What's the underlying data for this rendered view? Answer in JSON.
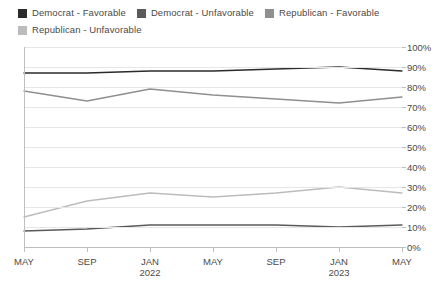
{
  "legend": {
    "position": "top-left",
    "items": [
      {
        "label": "Democrat - Favorable",
        "color": "#2b2b2b",
        "key": "dem_fav"
      },
      {
        "label": "Democrat - Unfavorable",
        "color": "#5a5a5a",
        "key": "dem_unfav"
      },
      {
        "label": "Republican - Favorable",
        "color": "#8f8f8f",
        "key": "rep_fav"
      },
      {
        "label": "Republican - Unfavorable",
        "color": "#bcbcbc",
        "key": "rep_unfav"
      }
    ]
  },
  "axes": {
    "y_labels": [
      "100%",
      "90%",
      "80%",
      "70%",
      "60%",
      "50%",
      "40%",
      "30%",
      "20%",
      "10%",
      "0%"
    ],
    "x_labels": [
      {
        "month": "MAY",
        "year": ""
      },
      {
        "month": "SEP",
        "year": ""
      },
      {
        "month": "JAN",
        "year": "2022"
      },
      {
        "month": "MAY",
        "year": ""
      },
      {
        "month": "SEP",
        "year": ""
      },
      {
        "month": "JAN",
        "year": "2023"
      },
      {
        "month": "MAY",
        "year": ""
      }
    ]
  },
  "chart_data": {
    "type": "line",
    "title": "",
    "subtitle": "",
    "xlabel": "",
    "ylabel": "",
    "ylim": [
      0,
      100
    ],
    "ytick_step": 10,
    "grid": true,
    "legend_position": "top-left",
    "x": [
      "MAY 2021",
      "SEP 2021",
      "JAN 2022",
      "MAY 2022",
      "SEP 2022",
      "JAN 2023",
      "MAY 2023"
    ],
    "x_tick_labels": [
      "MAY",
      "SEP",
      "JAN 2022",
      "MAY",
      "SEP",
      "JAN 2023",
      "MAY"
    ],
    "series": [
      {
        "name": "Democrat - Favorable",
        "color": "#2b2b2b",
        "values": [
          87,
          87,
          88,
          88,
          89,
          90,
          88
        ]
      },
      {
        "name": "Democrat - Unfavorable",
        "color": "#5a5a5a",
        "values": [
          8,
          9,
          11,
          11,
          11,
          10,
          11
        ]
      },
      {
        "name": "Republican - Favorable",
        "color": "#8f8f8f",
        "values": [
          78,
          73,
          79,
          76,
          74,
          72,
          75
        ]
      },
      {
        "name": "Republican - Unfavorable",
        "color": "#bcbcbc",
        "values": [
          15,
          23,
          27,
          25,
          27,
          30,
          27
        ]
      }
    ]
  }
}
